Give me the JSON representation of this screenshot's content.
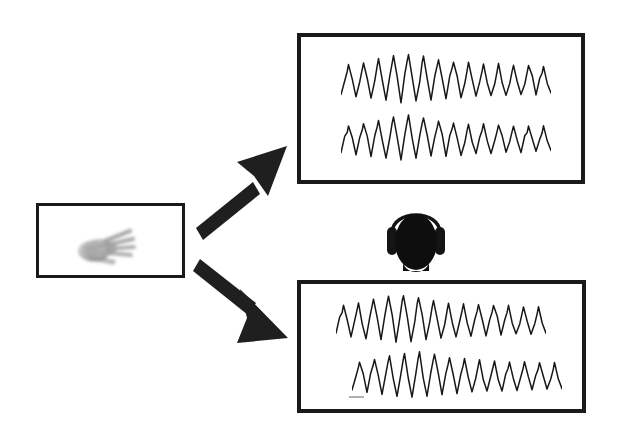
{
  "figure": {
    "background_color": "#ffffff",
    "line_color": "#1a1a1a",
    "arrow_color": "#1f1f1f",
    "scalebar_color": "#b0b0b0"
  },
  "stimulus": {
    "panel_name": "stimulus-panel",
    "image_label": "hand",
    "image_description": "grayscale blurred open hand, palm facing viewer, fingers spread",
    "border_width_px": 3
  },
  "listener": {
    "icon_label": "head-with-headphones",
    "description": "solid black head silhouette wearing over-ear headphones with headband"
  },
  "arrows": [
    {
      "name": "arrow-to-top-panel",
      "label": "up-right arrow",
      "direction": "up-right",
      "from": [
        196,
        221
      ],
      "to": [
        288,
        148
      ]
    },
    {
      "name": "arrow-to-bottom-panel",
      "label": "down-right arrow",
      "direction": "down-right",
      "from": [
        196,
        262
      ],
      "to": [
        288,
        330
      ]
    }
  ],
  "panels": [
    {
      "name": "eeg-panel-top",
      "position": "top-right",
      "border_width_px": 4,
      "traces": [
        {
          "name": "trace-top-1",
          "offset_x": 0,
          "baseline_y": 44
        },
        {
          "name": "trace-top-2",
          "offset_x": 0,
          "baseline_y": 105
        }
      ],
      "scalebar": false
    },
    {
      "name": "eeg-panel-bottom",
      "position": "bottom-right",
      "border_width_px": 4,
      "traces": [
        {
          "name": "trace-bottom-1",
          "offset_x": 0,
          "baseline_y": 38
        },
        {
          "name": "trace-bottom-2",
          "offset_x": 16,
          "baseline_y": 95
        }
      ],
      "scalebar": true
    }
  ],
  "chart_data": {
    "type": "line",
    "title": "",
    "xlabel": "",
    "ylabel": "",
    "grid": false,
    "legend": null,
    "n_cycles": 14,
    "x": [
      0,
      1,
      2,
      3,
      4,
      5,
      6,
      7,
      8,
      9,
      10,
      11,
      12,
      13,
      14,
      15,
      16,
      17,
      18,
      19,
      20,
      21,
      22,
      23,
      24,
      25,
      26,
      27,
      28
    ],
    "series": [
      {
        "name": "trace-top-1",
        "values": [
          -0.45,
          0.62,
          -0.52,
          0.7,
          -0.6,
          0.82,
          -0.66,
          0.95,
          -0.72,
          1.0,
          -0.7,
          0.92,
          -0.62,
          0.8,
          -0.58,
          0.72,
          -0.55,
          0.68,
          -0.52,
          0.66,
          -0.5,
          0.64,
          -0.48,
          0.62,
          -0.46,
          0.6,
          -0.44,
          0.58,
          -0.4
        ]
      },
      {
        "name": "trace-top-2",
        "values": [
          -0.42,
          0.58,
          -0.5,
          0.68,
          -0.58,
          0.8,
          -0.64,
          0.92,
          -0.7,
          0.98,
          -0.68,
          0.9,
          -0.6,
          0.78,
          -0.56,
          0.7,
          -0.54,
          0.66,
          -0.5,
          0.64,
          -0.48,
          0.62,
          -0.46,
          0.6,
          -0.44,
          0.58,
          -0.42,
          0.56,
          -0.38
        ]
      },
      {
        "name": "trace-bottom-1",
        "values": [
          -0.44,
          0.6,
          -0.54,
          0.72,
          -0.62,
          0.84,
          -0.68,
          0.97,
          -0.74,
          1.0,
          -0.7,
          0.9,
          -0.62,
          0.78,
          -0.58,
          0.7,
          -0.54,
          0.66,
          -0.52,
          0.64,
          -0.5,
          0.62,
          -0.48,
          0.6,
          -0.46,
          0.58,
          -0.44,
          0.56,
          -0.4
        ]
      },
      {
        "name": "trace-bottom-2",
        "values": [
          -0.46,
          0.62,
          -0.55,
          0.74,
          -0.63,
          0.86,
          -0.7,
          0.96,
          -0.74,
          1.0,
          -0.72,
          0.92,
          -0.64,
          0.8,
          -0.58,
          0.72,
          -0.56,
          0.68,
          -0.52,
          0.66,
          -0.5,
          0.64,
          -0.48,
          0.62,
          -0.46,
          0.6,
          -0.44,
          0.58,
          -0.42
        ]
      }
    ],
    "scalebar": {
      "name": "time-scalebar",
      "panel": "eeg-panel-bottom",
      "label": "",
      "length_px": 15
    }
  }
}
